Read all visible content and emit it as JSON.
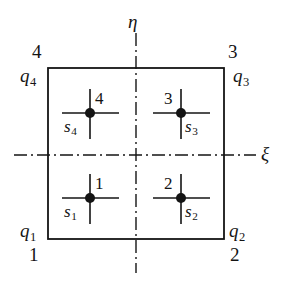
{
  "figure": {
    "type": "finite-element-reference-element-diagram",
    "axes": {
      "horizontal": {
        "label": "ξ",
        "name": "xi-axis",
        "style": "dash-dot"
      },
      "vertical": {
        "label": "η",
        "name": "eta-axis",
        "style": "dash-dot"
      }
    },
    "element": {
      "shape": "square",
      "stroke": "#141414"
    },
    "corners": [
      {
        "id": "corner-1",
        "position": "bottom-left",
        "number": "1",
        "q_base": "q",
        "q_sub": "1"
      },
      {
        "id": "corner-2",
        "position": "bottom-right",
        "number": "2",
        "q_base": "q",
        "q_sub": "2"
      },
      {
        "id": "corner-3",
        "position": "top-right",
        "number": "3",
        "q_base": "q",
        "q_sub": "3"
      },
      {
        "id": "corner-4",
        "position": "top-left",
        "number": "4",
        "q_base": "q",
        "q_sub": "4"
      }
    ],
    "integration_points": [
      {
        "id": "point-1",
        "quadrant": "bottom-left",
        "number": "1",
        "s_base": "s",
        "s_sub": "1",
        "num_side": "right",
        "s_side": "left"
      },
      {
        "id": "point-2",
        "quadrant": "bottom-right",
        "number": "2",
        "s_base": "s",
        "s_sub": "2",
        "num_side": "left",
        "s_side": "right"
      },
      {
        "id": "point-3",
        "quadrant": "top-right",
        "number": "3",
        "s_base": "s",
        "s_sub": "3",
        "num_side": "left",
        "s_side": "right"
      },
      {
        "id": "point-4",
        "quadrant": "top-left",
        "number": "4",
        "s_base": "s",
        "s_sub": "4",
        "num_side": "right",
        "s_side": "left"
      }
    ],
    "colors": {
      "ink": "#141414",
      "background": "#ffffff"
    }
  }
}
